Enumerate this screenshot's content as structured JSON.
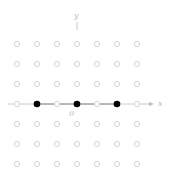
{
  "diagram": {
    "type": "integer-lattice",
    "axes": {
      "x_label": "x",
      "y_label": "y",
      "origin_label": "0"
    },
    "grid": {
      "columns": 7,
      "rows": 7,
      "x_range": [
        -3,
        3
      ],
      "y_range": [
        -3,
        3
      ]
    },
    "highlighted_points": [
      {
        "x": -2,
        "y": 0
      },
      {
        "x": 0,
        "y": 0
      },
      {
        "x": 2,
        "y": 0
      }
    ],
    "colors": {
      "open_point": "#cfcfcf",
      "filled_point": "#000000",
      "axis": "#bdbdbd",
      "highlight_segment": "#808080"
    }
  }
}
